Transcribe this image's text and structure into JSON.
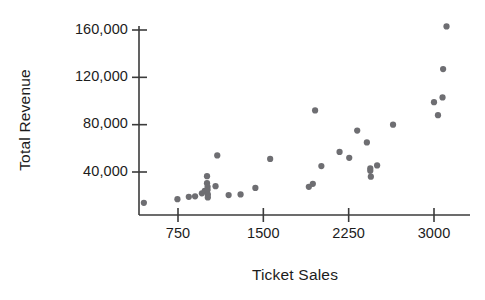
{
  "chart_data": {
    "type": "scatter",
    "title": "",
    "xlabel": "Ticket Sales",
    "ylabel": "Total Revenue",
    "xlim": [
      400,
      3250
    ],
    "ylim": [
      0,
      175000
    ],
    "xticks": [
      750,
      1500,
      2250,
      3000
    ],
    "xtick_labels": [
      "750",
      "1500",
      "2250",
      "3000"
    ],
    "yticks": [
      40000,
      80000,
      120000,
      160000
    ],
    "ytick_labels": [
      "40,000",
      "80,000",
      "120,000",
      "160,000"
    ],
    "grid": false,
    "legend": null,
    "marker": {
      "shape": "circle",
      "color": "#6e6e72",
      "size": 4
    },
    "points": [
      {
        "x": 450,
        "y": 14000
      },
      {
        "x": 745,
        "y": 17000
      },
      {
        "x": 845,
        "y": 19000
      },
      {
        "x": 900,
        "y": 19500
      },
      {
        "x": 960,
        "y": 22000
      },
      {
        "x": 985,
        "y": 24000
      },
      {
        "x": 1005,
        "y": 36500
      },
      {
        "x": 1005,
        "y": 30500
      },
      {
        "x": 1010,
        "y": 27500
      },
      {
        "x": 1010,
        "y": 25000
      },
      {
        "x": 1012,
        "y": 21000
      },
      {
        "x": 1012,
        "y": 18500
      },
      {
        "x": 1095,
        "y": 54000
      },
      {
        "x": 1080,
        "y": 28000
      },
      {
        "x": 1195,
        "y": 20500
      },
      {
        "x": 1300,
        "y": 21000
      },
      {
        "x": 1430,
        "y": 26500
      },
      {
        "x": 1560,
        "y": 51000
      },
      {
        "x": 1900,
        "y": 27500
      },
      {
        "x": 1935,
        "y": 30000
      },
      {
        "x": 1955,
        "y": 92000
      },
      {
        "x": 2010,
        "y": 45000
      },
      {
        "x": 2170,
        "y": 57000
      },
      {
        "x": 2255,
        "y": 52000
      },
      {
        "x": 2325,
        "y": 75000
      },
      {
        "x": 2410,
        "y": 65000
      },
      {
        "x": 2440,
        "y": 43000
      },
      {
        "x": 2440,
        "y": 41000
      },
      {
        "x": 2445,
        "y": 36000
      },
      {
        "x": 2500,
        "y": 45500
      },
      {
        "x": 2640,
        "y": 80000
      },
      {
        "x": 3000,
        "y": 99000
      },
      {
        "x": 3035,
        "y": 88000
      },
      {
        "x": 3075,
        "y": 103000
      },
      {
        "x": 3080,
        "y": 127000
      },
      {
        "x": 3110,
        "y": 163000
      }
    ]
  }
}
